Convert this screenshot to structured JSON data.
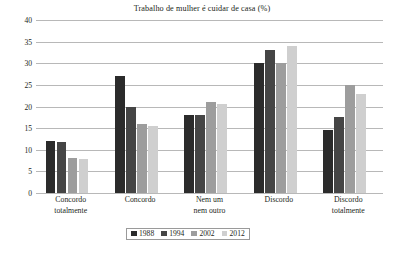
{
  "chart_data": {
    "type": "bar",
    "title": "Trabalho de mulher é cuidar de casa (%)",
    "xlabel": "",
    "ylabel": "",
    "ylim": [
      0,
      40
    ],
    "ytick_step": 5,
    "yticks": [
      0,
      5,
      10,
      15,
      20,
      25,
      30,
      35,
      40
    ],
    "grid": true,
    "legend_position": "bottom-center",
    "categories": [
      "Concordo totalmente",
      "Concordo",
      "Nem um nem outro",
      "Discordo",
      "Discordo totalmente"
    ],
    "category_lines": [
      [
        "Concordo",
        "totalmente"
      ],
      [
        "Concordo",
        ""
      ],
      [
        "Nem um",
        "nem outro"
      ],
      [
        "Discordo",
        ""
      ],
      [
        "Discordo",
        "totalmente"
      ]
    ],
    "series": [
      {
        "name": "1988",
        "color": "#2b2b2b",
        "values": [
          12,
          27,
          18,
          30,
          14.5
        ]
      },
      {
        "name": "1994",
        "color": "#454545",
        "values": [
          11.8,
          20,
          18,
          33,
          17.5
        ]
      },
      {
        "name": "2002",
        "color": "#9d9d9d",
        "values": [
          8,
          16,
          21,
          30,
          25
        ]
      },
      {
        "name": "2012",
        "color": "#cfcfcf",
        "values": [
          7.8,
          15.5,
          20.5,
          34,
          23
        ]
      }
    ]
  },
  "axis": {
    "ytick_labels": [
      "0",
      "5",
      "10",
      "15",
      "20",
      "25",
      "30",
      "35",
      "40"
    ]
  },
  "colors": {
    "gridline": "#b8b8b8",
    "text": "#231f20",
    "legend_border": "#9a9a9a",
    "background": "#ffffff"
  }
}
